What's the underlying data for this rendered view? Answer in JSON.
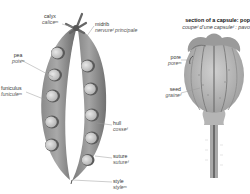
{
  "diagram": {
    "left_figure": {
      "name": "pea pod",
      "labels": [
        {
          "en": "calyx",
          "fr": "caliceᵐ"
        },
        {
          "en": "midrib",
          "fr": "nervureᶠ principale"
        },
        {
          "en": "pea",
          "fr": "poisᵐ"
        },
        {
          "en": "funiculus",
          "fr": "funiculeᵐ"
        },
        {
          "en": "hull",
          "fr": "cosseᶠ"
        },
        {
          "en": "suture",
          "fr": "sutureᶠ"
        },
        {
          "en": "style",
          "fr": "styleᵐ"
        }
      ]
    },
    "right_figure": {
      "title_en": "section of a capsule: pop",
      "title_fr": "coupeᶠ d'une capsuleᶠ : pavo",
      "labels": [
        {
          "en": "pore",
          "fr": "poreᵐ"
        },
        {
          "en": "seed",
          "fr": "graineᶠ"
        }
      ]
    },
    "colors": {
      "pod_dark": "#6e6e6e",
      "pod_mid": "#9a9a9a",
      "pod_light": "#c8c8c8",
      "pea_fill": "#d9d9d9",
      "capsule": "#bdbdbd",
      "leader_line": "#9a9a9a",
      "background": "#ffffff"
    }
  }
}
